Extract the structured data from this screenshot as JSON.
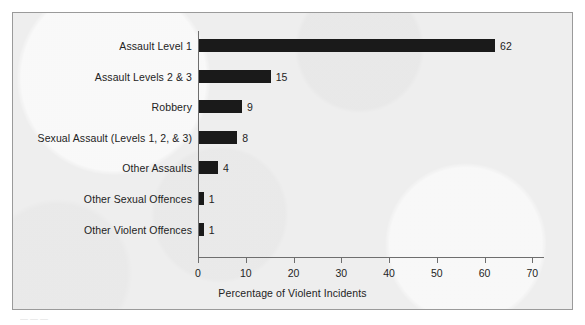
{
  "figure": {
    "background_color": "#eeeeee",
    "frame_color": "#9a9a9a",
    "bar_color": "#1a1a1a",
    "axis_color": "#6e6e6e",
    "text_color": "#232323",
    "caption_fragment": "———"
  },
  "chart_data": {
    "type": "bar",
    "orientation": "horizontal",
    "title": "",
    "xlabel": "Percentage of Violent Incidents",
    "ylabel": "",
    "categories": [
      "Assault Level 1",
      "Assault Levels 2 & 3",
      "Robbery",
      "Sexual Assault (Levels 1, 2, & 3)",
      "Other Assaults",
      "Other Sexual Offences",
      "Other Violent Offences"
    ],
    "values": [
      62,
      15,
      9,
      8,
      4,
      1,
      1
    ],
    "value_labels": [
      "62",
      "15",
      "9",
      "8",
      "4",
      "1",
      "1"
    ],
    "xlim": [
      0,
      70
    ],
    "xticks": [
      0,
      10,
      20,
      30,
      40,
      50,
      60,
      70
    ],
    "xtick_labels": [
      "0",
      "10",
      "20",
      "30",
      "40",
      "50",
      "60",
      "70"
    ],
    "grid": false,
    "legend": false
  }
}
